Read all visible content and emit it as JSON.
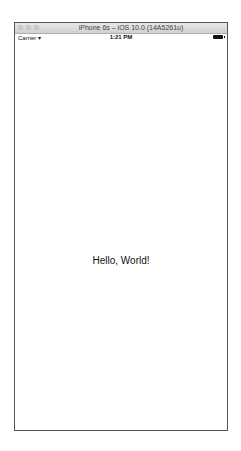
{
  "window": {
    "title": "iPhone 6s – iOS 10.0 (14A5261u)"
  },
  "status_bar": {
    "carrier": "Carrier",
    "wifi_icon": "wifi-icon",
    "time": "1:21 PM",
    "battery_icon": "battery-full-icon"
  },
  "screen": {
    "label": "Hello, World!"
  }
}
